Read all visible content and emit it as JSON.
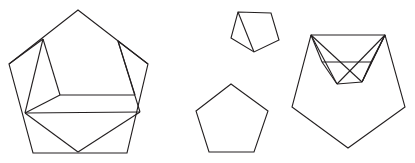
{
  "canvas": {
    "width": 415,
    "height": 163,
    "background_color": "#ffffff",
    "stroke_color": "#231f20",
    "stroke_width": 1.1,
    "description": "Line drawing of four pentagon figures: three folded/creased pentagons and one plain pentagon"
  },
  "figures": [
    {
      "id": "left-folded-pentagon",
      "label": "large folded pentagon with interior crease lines",
      "outline": "M 78,10 L 148,64 L 127,153 L 33,153 L 9,64 Z",
      "creases": [
        "M 43,39 L 25,113",
        "M 43,39 L 60,95",
        "M 43,39 L 9,64",
        "M 60,95 L 25,113",
        "M 60,95 L 135,95",
        "M 135,95 L 118,41",
        "M 118,41 L 148,64",
        "M 118,41 L 140,112",
        "M 140,112 L 25,113",
        "M 25,113 L 78,152",
        "M 140,112 L 78,152"
      ]
    },
    {
      "id": "top-small-pentagon",
      "label": "small pentagon with one diagonal crease",
      "outline": "M 238,12 L 271,13 L 279,40 L 254,52 L 231,38 Z",
      "creases": [
        "M 238,12 L 254,52"
      ]
    },
    {
      "id": "bottom-plain-pentagon",
      "label": "plain pentagon, no creases",
      "outline": "M 231,84 L 268,111 L 254,152 L 209,152 L 196,111 Z",
      "creases": []
    },
    {
      "id": "right-folded-pentagon",
      "label": "pentagon with flat top and interior crease lines",
      "outline": "M 311,35 L 385,35 L 405,107 L 348,148 L 292,107 Z",
      "creases": [
        "M 311,35 L 337,84",
        "M 337,84 L 385,35",
        "M 311,35 L 362,82",
        "M 362,82 L 385,35",
        "M 337,84 L 362,82",
        "M 311,35 L 322,62",
        "M 322,62 L 337,84",
        "M 322,62 L 371,62",
        "M 371,62 L 385,35",
        "M 371,62 L 362,82",
        "M 385,35 L 362,82"
      ]
    }
  ]
}
